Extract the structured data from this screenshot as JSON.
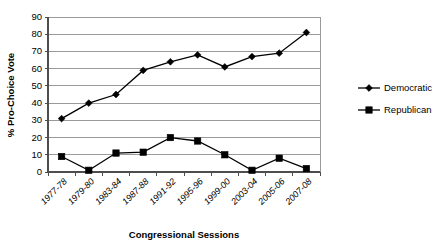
{
  "chart_data": {
    "type": "line",
    "title": "",
    "xlabel": "Congressional Sessions",
    "ylabel": "% Pro-Choice Vote",
    "ylim": [
      0,
      90
    ],
    "ytick_step": 10,
    "yticks": [
      0,
      10,
      20,
      30,
      40,
      50,
      60,
      70,
      80,
      90
    ],
    "grid": "horizontal",
    "legend_position": "right",
    "categories": [
      "1977-78",
      "1979-80",
      "1983-84",
      "1987-88",
      "1991-92",
      "1995-96",
      "1999-00",
      "2003-04",
      "2005-06",
      "2007-08"
    ],
    "series": [
      {
        "name": "Democratic",
        "marker": "diamond",
        "color": "#000000",
        "values": [
          31,
          40,
          45,
          59,
          64,
          68,
          61,
          67,
          69,
          81
        ]
      },
      {
        "name": "Republican",
        "marker": "square",
        "color": "#000000",
        "values": [
          9,
          1,
          11,
          11.5,
          20,
          18,
          10,
          1,
          8,
          2
        ]
      }
    ]
  },
  "legend": {
    "items": [
      {
        "label": "Democratic",
        "marker": "diamond"
      },
      {
        "label": "Republican",
        "marker": "square"
      }
    ]
  }
}
